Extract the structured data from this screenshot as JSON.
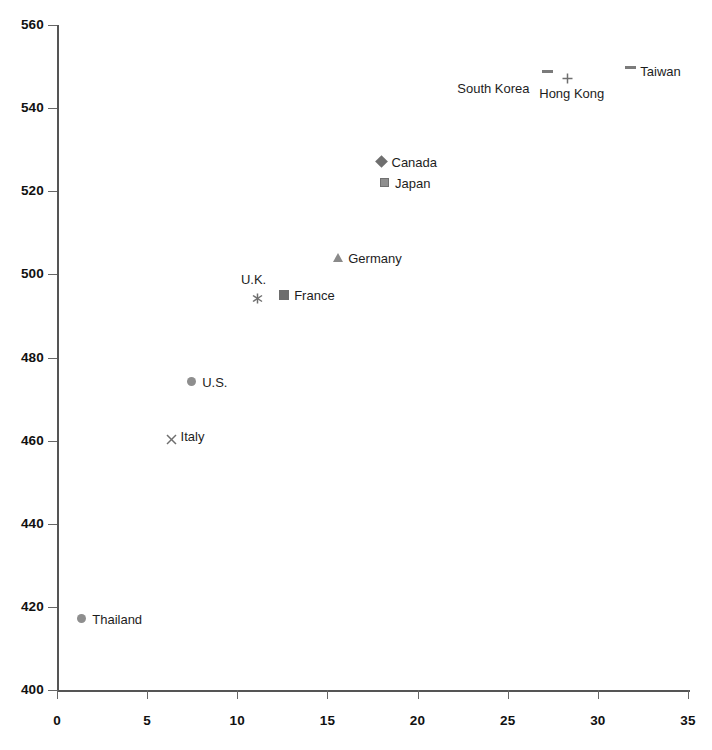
{
  "chart_data": {
    "type": "scatter",
    "title": "",
    "subtitle": "",
    "xlabel": "",
    "ylabel": "",
    "xlim": [
      0,
      35
    ],
    "ylim": [
      400,
      560
    ],
    "xticks": [
      "0",
      "5",
      "10",
      "15",
      "20",
      "25",
      "30",
      "35"
    ],
    "yticks": [
      "400",
      "420",
      "440",
      "460",
      "480",
      "500",
      "520",
      "540",
      "560"
    ],
    "grid": false,
    "legend": "none (inline point labels)",
    "points": [
      {
        "label": "Thailand",
        "x": 1.4,
        "y": 417,
        "marker": "circle",
        "label_pos": "right"
      },
      {
        "label": "Italy",
        "x": 6.3,
        "y": 461,
        "marker": "x",
        "label_pos": "right"
      },
      {
        "label": "U.S.",
        "x": 7.5,
        "y": 474,
        "marker": "circle",
        "label_pos": "right"
      },
      {
        "label": "U.K.",
        "x": 11.1,
        "y": 495,
        "marker": "star",
        "label_pos": "above"
      },
      {
        "label": "France",
        "x": 12.6,
        "y": 495,
        "marker": "square-dk",
        "label_pos": "right"
      },
      {
        "label": "Germany",
        "x": 15.6,
        "y": 504,
        "marker": "triangle",
        "label_pos": "right"
      },
      {
        "label": "Japan",
        "x": 18.2,
        "y": 522,
        "marker": "square",
        "label_pos": "right"
      },
      {
        "label": "Canada",
        "x": 18.0,
        "y": 527,
        "marker": "diamond",
        "label_pos": "right"
      },
      {
        "label": "South Korea",
        "x": 27.2,
        "y": 548,
        "marker": "dash",
        "label_pos": "left"
      },
      {
        "label": "Hong Kong",
        "x": 28.3,
        "y": 548,
        "marker": "plus",
        "label_pos": "below"
      },
      {
        "label": "Taiwan",
        "x": 31.8,
        "y": 549,
        "marker": "dash",
        "label_pos": "right"
      }
    ]
  }
}
